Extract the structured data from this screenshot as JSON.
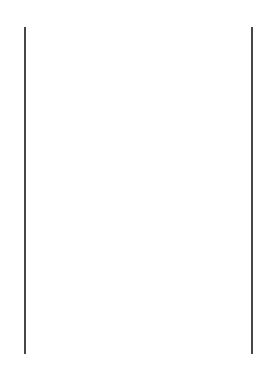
{
  "figure": {
    "label": "b.",
    "frame": {
      "left_post_x": 25,
      "right_post_x": 252,
      "top_y": 27,
      "bottom_y": 354
    },
    "warp_threads": {
      "count": 12,
      "x_positions": [
        43,
        60,
        78,
        96,
        113,
        131,
        148,
        166,
        183,
        201,
        218,
        236
      ],
      "top_y": 228,
      "bottom_y": 354,
      "style": "dashed above and below weave, solid in weave"
    },
    "weft_rows": {
      "y_positions": [
        263,
        281,
        300,
        318
      ],
      "left_loops": [
        [
          263,
          281
        ],
        [
          300,
          318
        ]
      ],
      "right_loops": [
        [
          281,
          300
        ]
      ],
      "right_ends": [
        263,
        318
      ]
    },
    "line_color": "#1a1a1a"
  }
}
